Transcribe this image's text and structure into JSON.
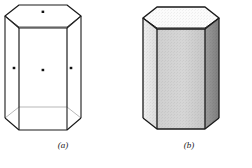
{
  "figure": {
    "type": "geometry-illustration",
    "background_color": "#ffffff",
    "ink_color": "#1a1a1a",
    "panels": [
      {
        "id": "a",
        "caption": "(a)",
        "style": "wireframe",
        "description": "Transparent wireframe hexagonal prism with visible hidden edges at the base and dots marking face centers",
        "hidden_edge_style": "faint-thin-line",
        "marker_count": 4,
        "markers": [
          {
            "name": "top-face-center-dot",
            "x": 43,
            "y": 12
          },
          {
            "name": "left-face-center-dot",
            "x": 14,
            "y": 68
          },
          {
            "name": "front-face-center-dot",
            "x": 43,
            "y": 70
          },
          {
            "name": "right-face-center-dot",
            "x": 71,
            "y": 68
          }
        ],
        "marker_color": "#111111",
        "outline_width_px": 1.1
      },
      {
        "id": "b",
        "caption": "(b)",
        "style": "shaded-solid",
        "description": "Opaque shaded hexagonal prism with three visible lateral faces of differing gray values and a dashed hidden base edge",
        "hidden_edge_style": "dashed",
        "faces": [
          {
            "name": "top-face",
            "shade": "#fbfbfb",
            "label": "top"
          },
          {
            "name": "left-lateral-face",
            "shade": "#e4e4e4",
            "label": "left"
          },
          {
            "name": "front-lateral-face",
            "shade": "#d0d0d0",
            "label": "front"
          },
          {
            "name": "right-lateral-face",
            "shade": "#8f8f8f",
            "label": "right"
          }
        ],
        "outline_width_px": 1.4
      }
    ]
  },
  "captions": {
    "a": "(a)",
    "b": "(b)"
  }
}
